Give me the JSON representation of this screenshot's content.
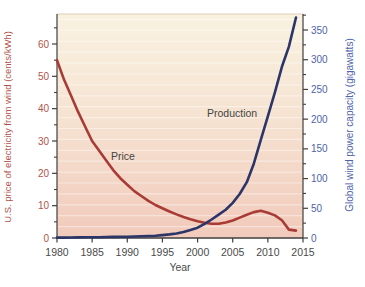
{
  "figure": {
    "x_axis": {
      "label": "Year",
      "ticks": [
        1980,
        1985,
        1990,
        1995,
        2000,
        2005,
        2010,
        2015
      ],
      "range": [
        1980,
        2015
      ]
    },
    "left_axis": {
      "label": "U.S. price of electricity from wind (cents/kWh)",
      "ticks": [
        0,
        10,
        20,
        30,
        40,
        50,
        60
      ],
      "minor_step": 5,
      "minor_max": 65,
      "range": [
        0,
        60
      ],
      "text_color": "#b2544d"
    },
    "right_axis": {
      "label": "Global wind power capacity (gigawatts)",
      "ticks": [
        0,
        50,
        100,
        150,
        200,
        250,
        300,
        350
      ],
      "minor_step": 25,
      "minor_max": 375,
      "range": [
        0,
        350
      ],
      "text_color": "#5063a8"
    },
    "colors": {
      "plot_bg_top": "#f9f2e1",
      "plot_bg_mid": "#f6e3d2",
      "plot_bg_bottom": "#f1cabb",
      "stripe": "rgba(255,255,255,0.42)",
      "axis_line": "#3f3f3f",
      "neutral_text": "#4a4a4a",
      "annotation_text": "#454545",
      "plot_top_edge": "rgba(170,140,100,0.38)"
    }
  },
  "chart_data": {
    "type": "line",
    "title": "",
    "xlabel": "Year",
    "ylabel_left": "U.S. price of electricity from wind (cents/kWh)",
    "ylabel_right": "Global wind power capacity (gigawatts)",
    "x_range": [
      1980,
      2015
    ],
    "left_ylim": [
      0,
      60
    ],
    "right_ylim": [
      0,
      350
    ],
    "grid": "faint-horizontal-stripes",
    "legend": "inline-annotations",
    "x": [
      1980,
      1981,
      1982,
      1983,
      1984,
      1985,
      1986,
      1987,
      1988,
      1989,
      1990,
      1991,
      1992,
      1993,
      1994,
      1995,
      1996,
      1997,
      1998,
      1999,
      2000,
      2001,
      2002,
      2003,
      2004,
      2005,
      2006,
      2007,
      2008,
      2009,
      2010,
      2011,
      2012,
      2013,
      2014
    ],
    "series": [
      {
        "name": "Price",
        "axis": "left",
        "units": "cents/kWh",
        "color": "#a93b36",
        "values": [
          55,
          49,
          44,
          39,
          34.5,
          30,
          27,
          24,
          21,
          18.5,
          16.5,
          14.5,
          13,
          11.5,
          10.2,
          9.2,
          8.2,
          7.3,
          6.5,
          5.8,
          5.2,
          4.7,
          4.4,
          4.4,
          4.8,
          5.4,
          6.3,
          7.2,
          8.0,
          8.4,
          7.8,
          7.0,
          5.5,
          2.6,
          2.3
        ]
      },
      {
        "name": "Production",
        "axis": "right",
        "units": "gigawatts",
        "color": "#2c3568",
        "values": [
          0.6,
          0.7,
          0.9,
          1.0,
          1.1,
          1.2,
          1.4,
          1.6,
          1.8,
          2.0,
          2.2,
          2.6,
          3.0,
          3.4,
          3.9,
          4.8,
          6.1,
          7.6,
          10.2,
          13.6,
          17.4,
          23.9,
          31.1,
          39.4,
          47.6,
          59.1,
          74.1,
          93.9,
          125,
          165,
          205,
          245,
          288,
          322,
          371
        ]
      }
    ],
    "annotations": [
      {
        "text": "Price",
        "px": 111,
        "py": 160
      },
      {
        "text": "Production",
        "px": 207,
        "py": 117
      }
    ]
  }
}
